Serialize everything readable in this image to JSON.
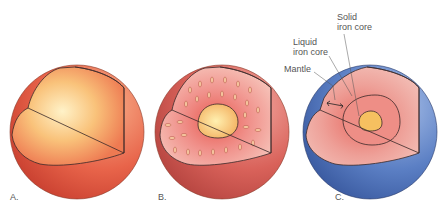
{
  "panels": [
    {
      "id": "A",
      "label": "A."
    },
    {
      "id": "B",
      "label": "B."
    },
    {
      "id": "C",
      "label": "C."
    }
  ],
  "annotations": {
    "solid_core_1": "Solid",
    "solid_core_2": "iron core",
    "liquid_core_1": "Liquid",
    "liquid_core_2": "iron core",
    "mantle": "Mantle"
  },
  "colors": {
    "outer_orange": "#e8644a",
    "inner_yellow": "#fbe0a0",
    "mantle_pink": "#e58f88",
    "crust_blue": "#5b7fc4",
    "outline": "#3a2a2a"
  }
}
